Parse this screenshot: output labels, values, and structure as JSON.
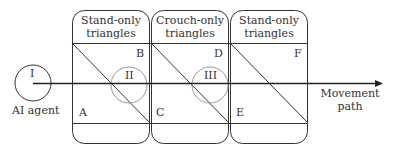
{
  "diagram": {
    "agent": {
      "label": "AI agent",
      "numeral": "I"
    },
    "regions": [
      {
        "title_line1": "Stand-only",
        "title_line2": "triangles",
        "corner_top": "B",
        "corner_bottom": "A",
        "circle": "II"
      },
      {
        "title_line1": "Crouch-only",
        "title_line2": "triangles",
        "corner_top": "D",
        "corner_bottom": "C",
        "circle": "III"
      },
      {
        "title_line1": "Stand-only",
        "title_line2": "triangles",
        "corner_top": "F",
        "corner_bottom": "E",
        "circle": ""
      }
    ],
    "path_label_line1": "Movement",
    "path_label_line2": "path",
    "colors": {
      "line": "#222222",
      "circle_light": "#999999"
    }
  }
}
